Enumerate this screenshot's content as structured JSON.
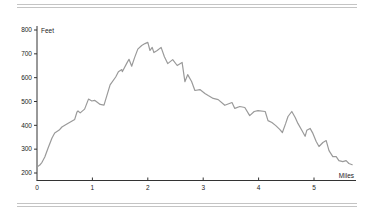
{
  "chart_data": {
    "type": "line",
    "title": "",
    "xlabel": "Miles",
    "ylabel": "Feet",
    "xlim": [
      0,
      5.8
    ],
    "ylim": [
      180,
      820
    ],
    "grid": false,
    "legend": "none",
    "x_ticks": [
      0,
      1,
      2,
      3,
      4,
      5
    ],
    "x_tick_labels": [
      "0",
      "1",
      "2",
      "3",
      "4",
      "5"
    ],
    "y_ticks": [
      200,
      300,
      400,
      500,
      600,
      700,
      800
    ],
    "y_tick_labels": [
      "200",
      "300",
      "400",
      "500",
      "600",
      "700",
      "800"
    ],
    "series": [
      {
        "name": "Elevation profile",
        "color": "#9a9a9a",
        "x": [
          0.0,
          0.05,
          0.09,
          0.14,
          0.2,
          0.27,
          0.32,
          0.4,
          0.45,
          0.54,
          0.68,
          0.72,
          0.74,
          0.78,
          0.86,
          0.93,
          0.99,
          1.04,
          1.14,
          1.21,
          1.32,
          1.42,
          1.47,
          1.53,
          1.54,
          1.62,
          1.66,
          1.71,
          1.76,
          1.82,
          1.89,
          1.95,
          2.0,
          2.04,
          2.08,
          2.11,
          2.17,
          2.24,
          2.3,
          2.36,
          2.45,
          2.53,
          2.62,
          2.67,
          2.72,
          2.79,
          2.85,
          2.94,
          3.03,
          3.09,
          3.18,
          3.27,
          3.39,
          3.52,
          3.57,
          3.66,
          3.75,
          3.84,
          3.92,
          3.99,
          4.12,
          4.17,
          4.24,
          4.31,
          4.38,
          4.43,
          4.49,
          4.53,
          4.6,
          4.66,
          4.71,
          4.78,
          4.84,
          4.87,
          4.93,
          4.98,
          5.04,
          5.09,
          5.16,
          5.22,
          5.27,
          5.34,
          5.4,
          5.45,
          5.52,
          5.58,
          5.63,
          5.69
        ],
        "y": [
          225,
          233,
          245,
          267,
          305,
          347,
          368,
          380,
          393,
          405,
          425,
          455,
          460,
          452,
          468,
          510,
          502,
          505,
          488,
          485,
          570,
          603,
          625,
          634,
          625,
          660,
          677,
          648,
          683,
          720,
          735,
          743,
          748,
          714,
          727,
          705,
          714,
          727,
          688,
          659,
          676,
          651,
          664,
          583,
          613,
          584,
          546,
          550,
          534,
          525,
          513,
          508,
          484,
          496,
          471,
          479,
          475,
          441,
          458,
          462,
          458,
          420,
          412,
          399,
          383,
          370,
          408,
          437,
          458,
          433,
          408,
          379,
          354,
          379,
          387,
          366,
          332,
          311,
          328,
          336,
          294,
          269,
          269,
          252,
          248,
          252,
          240,
          235
        ]
      }
    ]
  }
}
